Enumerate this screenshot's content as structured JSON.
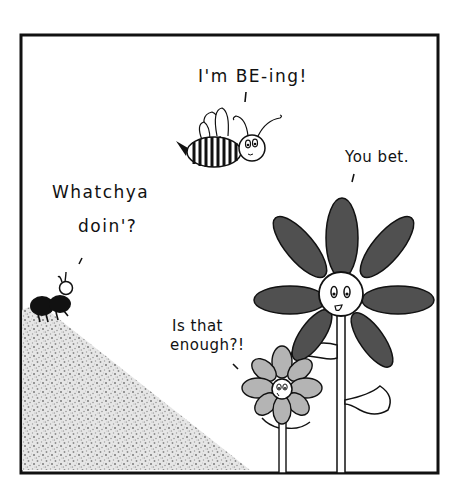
{
  "comic": {
    "panel": {
      "border_color": "#111111",
      "background": "#ffffff"
    },
    "dialogue": [
      {
        "speaker": "bee",
        "text": "I'm BE-ing!"
      },
      {
        "speaker": "big-flower",
        "text": "You bet."
      },
      {
        "speaker": "ant",
        "line1": "Whatchya",
        "line2": "doin'?"
      },
      {
        "speaker": "small-flower",
        "line1": "Is that",
        "line2": "enough?!"
      }
    ],
    "characters": [
      "bee",
      "ant",
      "big-flower",
      "small-flower"
    ],
    "colors": {
      "ink": "#111111",
      "big_flower_petals": "#505050",
      "small_flower_petals": "#b4b4b4",
      "hill_stipple": "#9a9a9a"
    }
  }
}
